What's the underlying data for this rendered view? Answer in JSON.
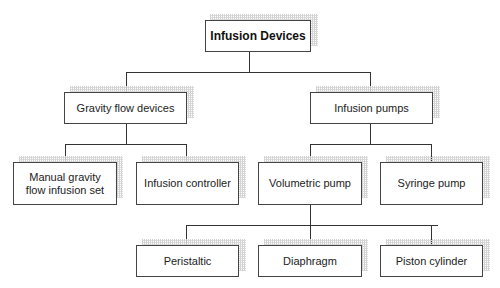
{
  "diagram": {
    "type": "tree",
    "root": {
      "label": "Infusion Devices"
    },
    "level1": [
      {
        "label": "Gravity flow devices"
      },
      {
        "label": "Infusion pumps"
      }
    ],
    "level2": [
      {
        "label": "Manual gravity flow infusion set",
        "parent": "Gravity flow devices"
      },
      {
        "label": "Infusion controller",
        "parent": "Gravity flow devices"
      },
      {
        "label": "Volumetric pump",
        "parent": "Infusion pumps"
      },
      {
        "label": "Syringe pump",
        "parent": "Infusion pumps"
      }
    ],
    "level3": [
      {
        "label": "Peristaltic",
        "parent": "Volumetric pump"
      },
      {
        "label": "Diaphragm",
        "parent": "Volumetric pump"
      },
      {
        "label": "Piston cylinder",
        "parent": "Volumetric pump"
      }
    ]
  },
  "colors": {
    "border": "#444444",
    "line": "#333333",
    "shadow": "#cfcfcf",
    "background": "#ffffff"
  }
}
